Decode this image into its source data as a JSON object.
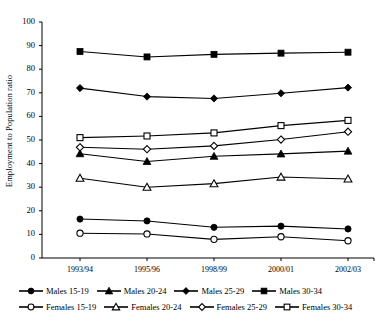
{
  "chart_data": {
    "type": "line",
    "title": "",
    "subtitle": "",
    "xlabel": "",
    "ylabel": "Employment to Population ratio",
    "categories": [
      "1993/94",
      "1995/96",
      "1998/99",
      "2000/01",
      "2002/03"
    ],
    "ylim": [
      0,
      100
    ],
    "ytick_step": 10,
    "yticks": [
      0,
      10,
      20,
      30,
      40,
      50,
      60,
      70,
      80,
      90,
      100
    ],
    "ytick_labels": [
      "0",
      "10",
      "20",
      "30",
      "40",
      "50",
      "60",
      "70",
      "80",
      "90",
      "100"
    ],
    "grid": false,
    "legend_position": "bottom",
    "series": [
      {
        "name": "Males 15-19",
        "marker": "filled-circle",
        "values": [
          16.5,
          15.7,
          13.0,
          13.5,
          12.3
        ]
      },
      {
        "name": "Males 20-24",
        "marker": "filled-triangle",
        "values": [
          44.2,
          40.9,
          43.1,
          44.1,
          45.3
        ]
      },
      {
        "name": "Males 25-29",
        "marker": "filled-diamond",
        "values": [
          72.0,
          68.4,
          67.6,
          69.8,
          72.2
        ]
      },
      {
        "name": "Males 30-34",
        "marker": "filled-square",
        "values": [
          87.5,
          85.2,
          86.3,
          86.8,
          87.2
        ]
      },
      {
        "name": "Females 15-19",
        "marker": "open-circle",
        "values": [
          10.5,
          10.2,
          7.9,
          9.0,
          7.3
        ]
      },
      {
        "name": "Females 20-24",
        "marker": "open-triangle",
        "values": [
          33.8,
          30.0,
          31.5,
          34.3,
          33.5
        ]
      },
      {
        "name": "Females 25-29",
        "marker": "open-diamond",
        "values": [
          46.9,
          46.1,
          47.5,
          50.2,
          53.5
        ]
      },
      {
        "name": "Females 30-34",
        "marker": "open-square",
        "values": [
          51.0,
          51.7,
          53.0,
          56.1,
          58.3
        ]
      }
    ]
  },
  "axis": {
    "y_title": "Employment to Population ratio"
  },
  "legend": {
    "row1": [
      "Males 15-19",
      "Males 20-24",
      "Males 25-29",
      "Males 30-34"
    ],
    "row2": [
      "Females 15-19",
      "Females 20-24",
      "Females 25-29",
      "Females 30-34"
    ]
  },
  "colors": {
    "line": "#000000",
    "marker_fill": "#000000",
    "marker_open_fill": "#ffffff",
    "background": "#ffffff",
    "axis": "#000000"
  }
}
